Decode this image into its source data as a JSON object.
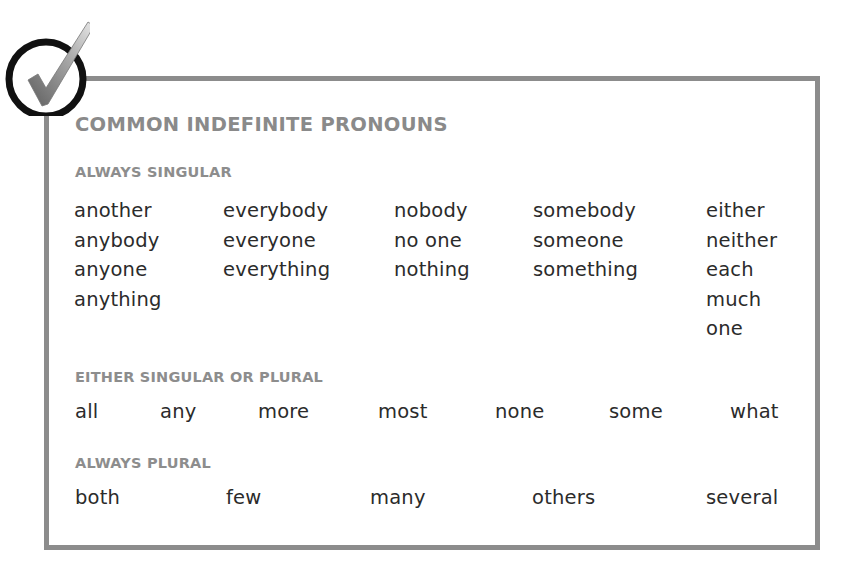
{
  "title": "COMMON INDEFINITE PRONOUNS",
  "badge": {
    "icon": "checkmark-circle-icon"
  },
  "colors": {
    "border": "#8c8c8c",
    "heading": "#8a8a8a",
    "text": "#2b2b2b",
    "ring": "#111111"
  },
  "sections": {
    "always_singular": {
      "heading": "ALWAYS SINGULAR",
      "columns": [
        [
          "another",
          "anybody",
          "anyone",
          "anything"
        ],
        [
          "everybody",
          "everyone",
          "everything"
        ],
        [
          "nobody",
          "no one",
          "nothing"
        ],
        [
          "somebody",
          "someone",
          "something"
        ],
        [
          "either",
          "neither",
          "each",
          "much",
          "one"
        ]
      ]
    },
    "either": {
      "heading": "EITHER SINGULAR OR PLURAL",
      "words": [
        "all",
        "any",
        "more",
        "most",
        "none",
        "some",
        "what"
      ]
    },
    "always_plural": {
      "heading": "ALWAYS PLURAL",
      "words": [
        "both",
        "few",
        "many",
        "others",
        "several"
      ]
    }
  }
}
